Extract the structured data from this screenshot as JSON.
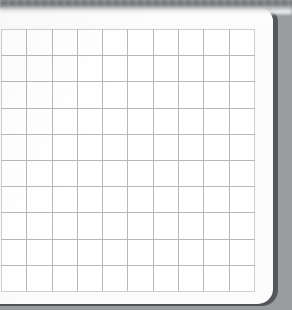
{
  "window": {
    "title": "Grid Sheet",
    "toolbar_strip_label": "blurred-toolbar"
  },
  "card": {
    "background_color": "#fbfbfb",
    "edge_color": "#55575a",
    "corner_radius_px": 15
  },
  "grid": {
    "name": "blank-grid",
    "columns": 10,
    "rows": 10,
    "cell_width_px": 25,
    "cell_height_px": 26,
    "line_color": "#b6b8ba",
    "outer_line_color": "#cdcfd1",
    "cell_fill_color": "#ffffff",
    "cells": [
      [
        "",
        "",
        "",
        "",
        "",
        "",
        "",
        "",
        "",
        ""
      ],
      [
        "",
        "",
        "",
        "",
        "",
        "",
        "",
        "",
        "",
        ""
      ],
      [
        "",
        "",
        "",
        "",
        "",
        "",
        "",
        "",
        "",
        ""
      ],
      [
        "",
        "",
        "",
        "",
        "",
        "",
        "",
        "",
        "",
        ""
      ],
      [
        "",
        "",
        "",
        "",
        "",
        "",
        "",
        "",
        "",
        ""
      ],
      [
        "",
        "",
        "",
        "",
        "",
        "",
        "",
        "",
        "",
        ""
      ],
      [
        "",
        "",
        "",
        "",
        "",
        "",
        "",
        "",
        "",
        ""
      ],
      [
        "",
        "",
        "",
        "",
        "",
        "",
        "",
        "",
        "",
        ""
      ],
      [
        "",
        "",
        "",
        "",
        "",
        "",
        "",
        "",
        "",
        ""
      ],
      [
        "",
        "",
        "",
        "",
        "",
        "",
        "",
        "",
        "",
        ""
      ]
    ]
  }
}
